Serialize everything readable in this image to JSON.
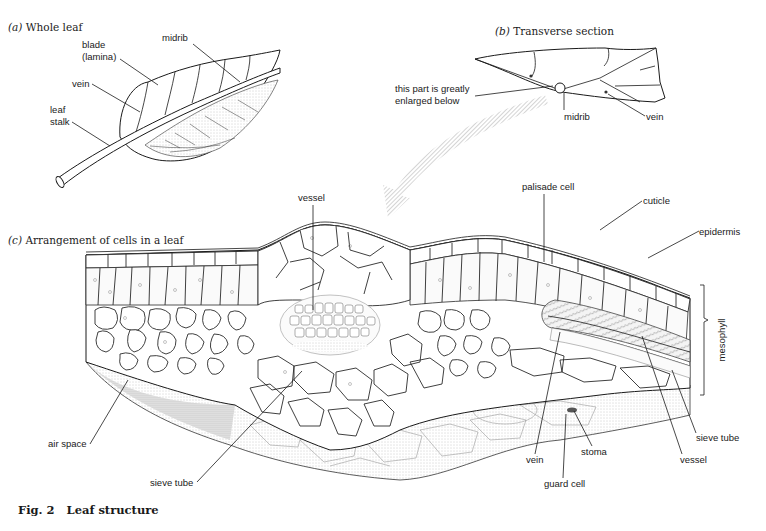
{
  "figure": {
    "title": "Fig. 2   Leaf structure",
    "colors": {
      "ink": "#1a1a1a",
      "paper": "#ffffff",
      "stipple": "#cfcfcf",
      "arrow": "#c8c8c8"
    }
  },
  "panels": {
    "whole_leaf": {
      "caption_letter": "(a)",
      "caption_text": "Whole leaf",
      "labels": {
        "midrib": "midrib",
        "blade_1": "blade",
        "blade_2": "(lamina)",
        "vein": "vein",
        "stalk_1": "leaf",
        "stalk_2": "stalk"
      }
    },
    "transverse_section": {
      "caption_letter": "(b)",
      "caption_text": "Transverse section",
      "labels": {
        "enlarged_1": "this part is greatly",
        "enlarged_2": "enlarged below",
        "midrib": "midrib",
        "vein": "vein"
      }
    },
    "cell_arrangement": {
      "caption_letter": "(c)",
      "caption_text": "Arrangement of cells in a leaf",
      "labels": {
        "vessel_top": "vessel",
        "palisade_cell": "palisade cell",
        "cuticle": "cuticle",
        "epidermis": "epidermis",
        "mesophyll": "mesophyll",
        "air_space": "air space",
        "sieve_tube_left": "sieve tube",
        "vein": "vein",
        "stoma": "stoma",
        "guard_cell": "guard cell",
        "vessel_right": "vessel",
        "sieve_tube_right": "sieve tube"
      }
    }
  }
}
